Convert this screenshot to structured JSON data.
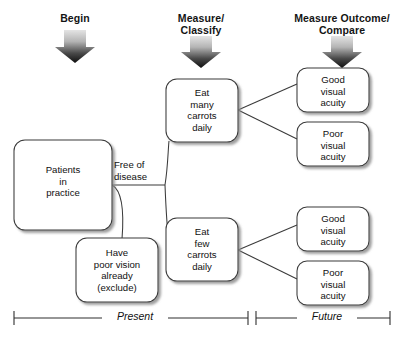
{
  "figure": {
    "kind": "study-design-flowchart",
    "background_color": "#ffffff",
    "line_color": "#3a3a3a",
    "text_color": "#101010",
    "arrow_gradient": [
      "#dcdcdc",
      "#1a1a1a"
    ]
  },
  "column_headers": [
    {
      "id": "begin",
      "label": "Begin"
    },
    {
      "id": "measure-classify",
      "label": "Measure/\nClassify"
    },
    {
      "id": "measure-outcome-compare",
      "label": "Measure Outcome/\nCompare"
    }
  ],
  "stage_arrows": [
    {
      "id": "arrow-begin",
      "for": "begin"
    },
    {
      "id": "arrow-measure-classify",
      "for": "measure-classify"
    },
    {
      "id": "arrow-measure-outcome",
      "for": "measure-outcome-compare"
    }
  ],
  "nodes": [
    {
      "id": "patients-in-practice",
      "label": "Patients\nin\npractice"
    },
    {
      "id": "have-poor-vision",
      "label": "Have\npoor vision\nalready\n(exclude)"
    },
    {
      "id": "eat-many-carrots",
      "label": "Eat\nmany\ncarrots\ndaily"
    },
    {
      "id": "eat-few-carrots",
      "label": "Eat\nfew\ncarrots\ndaily"
    },
    {
      "id": "outcome-many-good",
      "label": "Good\nvisual\nacuity"
    },
    {
      "id": "outcome-many-poor",
      "label": "Poor\nvisual\nacuity"
    },
    {
      "id": "outcome-few-good",
      "label": "Good\nvisual\nacuity"
    },
    {
      "id": "outcome-few-poor",
      "label": "Poor\nvisual\nacuity"
    }
  ],
  "edge_labels": [
    {
      "id": "free-of-disease",
      "label": "Free of\ndisease"
    }
  ],
  "timeline": {
    "segments": [
      {
        "id": "present",
        "label": "Present"
      },
      {
        "id": "future",
        "label": "Future"
      }
    ]
  }
}
